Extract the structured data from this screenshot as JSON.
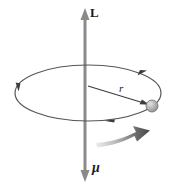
{
  "figure": {
    "background_color": "#ffffff",
    "labels": {
      "angular_momentum": "L",
      "magnetic_moment": "μ",
      "radius": "r"
    },
    "colors": {
      "axis_line": "#8a8a8a",
      "orbit_line": "#55555a",
      "radius_line": "#3c3c3c",
      "sphere_fill": "#a8a8a8",
      "sphere_highlight": "#d8d8d8",
      "sphere_stroke": "#6e6e6e",
      "motion_arrow_dark": "#4a4a4a",
      "motion_arrow_light": "#e4e4e4",
      "text": "#1a1a1a"
    },
    "geometry": {
      "axis_x": 85,
      "axis_top_y": 10,
      "axis_bottom_y": 180,
      "orbit_center_x": 88,
      "orbit_center_y": 93,
      "orbit_rx": 73,
      "orbit_ry": 28,
      "sphere_x": 152,
      "sphere_y": 106,
      "sphere_r": 6
    },
    "elements": [
      {
        "name": "angular-momentum-arrow",
        "direction": "up"
      },
      {
        "name": "magnetic-moment-arrow",
        "direction": "down"
      },
      {
        "name": "orbit-ellipse",
        "direction": "counterclockwise"
      },
      {
        "name": "radius-arrow",
        "from": "center",
        "to": "particle"
      },
      {
        "name": "particle-sphere"
      },
      {
        "name": "motion-arrow",
        "direction": "right"
      }
    ]
  }
}
